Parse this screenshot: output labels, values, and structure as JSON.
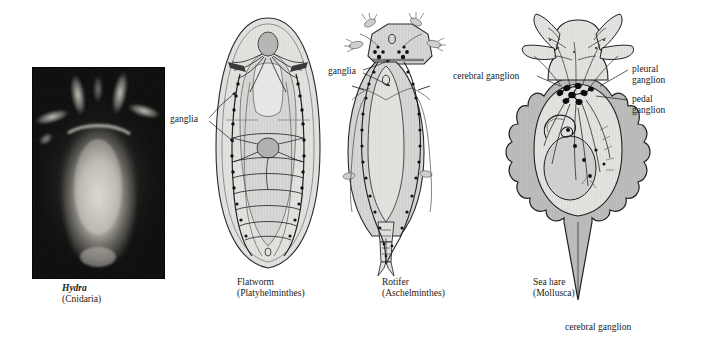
{
  "figure": {
    "background_color": "#ffffff",
    "ink_color": "#1a1a1a"
  },
  "panels": [
    {
      "id": "hydra",
      "kind": "photograph",
      "common_name": "Hydra",
      "phylum": "(Cnidaria)",
      "name_style": "bold-italic",
      "description": "dark-field fluorescence micrograph of a hydra with tentacles radiating from the top of a glowing column-shaped body",
      "photo_background": "#0a0a0a",
      "organism_glow": "#d8d6ce",
      "labels": []
    },
    {
      "id": "flatworm",
      "kind": "line-drawing",
      "common_name": "Flatworm",
      "phylum": "(Platyhelminthes)",
      "name_style": "regular",
      "body_fill": "#dededc",
      "inner_fill": "#e8e8e6",
      "ganglion_fill": "#b4b4b2",
      "description": "ladder-type nervous system with paired longitudinal nerve cords and transverse commissures",
      "labels": [
        {
          "text": "ganglia",
          "lines": [
            "ganglia"
          ],
          "leader": "double-arrow"
        }
      ]
    },
    {
      "id": "rotifer",
      "kind": "line-drawing",
      "common_name": "Rotifer",
      "phylum": "(Aschelminthes)",
      "name_style": "regular",
      "body_fill": "#d4d4d2",
      "inner_fill": "#dcdcda",
      "description": "rotifer with ciliated corona, tapering trunk and bifurcated foot, bearing paired ganglia",
      "labels": [
        {
          "text": "ganglia",
          "lines": [
            "ganglia"
          ],
          "leader": "double-arrow"
        }
      ]
    },
    {
      "id": "sea-hare",
      "kind": "line-drawing",
      "common_name": "Sea hare",
      "phylum": "(Mollusca)",
      "name_style": "regular",
      "body_fill": "#b9b9b7",
      "inner_fill": "#d7d7d5",
      "organ_fill": "#cfcfcd",
      "ganglion_color": "#111111",
      "description": "sea hare with rhinophores and oral tentacles, scalloped mantle, and a central cluster of ganglia",
      "labels": [
        {
          "text": "cerebral ganglion",
          "lines": [
            "cerebral ganglion"
          ],
          "leader": "line"
        },
        {
          "text": "pleural ganglion",
          "lines": [
            "pleural",
            "ganglion"
          ],
          "leader": "line"
        },
        {
          "text": "pedal ganglion",
          "lines": [
            "pedal",
            "ganglion"
          ],
          "leader": "line"
        }
      ]
    }
  ],
  "stray_text": {
    "text": "cerebral ganglion"
  }
}
